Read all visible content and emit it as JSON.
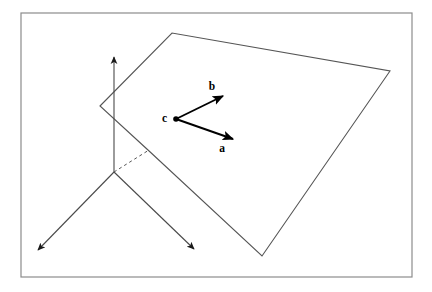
{
  "figure": {
    "title": "",
    "background_color": "#ffffff",
    "border": {
      "name": "figure-frame",
      "color": "#8c8c8c",
      "stroke_width": 1.2,
      "x": 21,
      "y": 13,
      "width": 391,
      "height": 264
    },
    "line_color": "#555555",
    "axis_color": "#4a4a4a",
    "vector_color": "#000000",
    "plane": {
      "name": "plane-polygon",
      "vertices": [
        {
          "x": 100,
          "y": 106
        },
        {
          "x": 172,
          "y": 33
        },
        {
          "x": 390,
          "y": 71
        },
        {
          "x": 262,
          "y": 256
        },
        {
          "x": 148,
          "y": 150
        }
      ],
      "closed": true,
      "stroke_width": 1.1
    },
    "axes": [
      {
        "name": "axis-vertical",
        "label": "",
        "from": {
          "x": 114,
          "y": 172
        },
        "to": {
          "x": 114,
          "y": 57
        },
        "arrow": true,
        "stroke_width": 1.1
      },
      {
        "name": "axis-lower-left",
        "label": "",
        "from": {
          "x": 114,
          "y": 172
        },
        "to": {
          "x": 38,
          "y": 250
        },
        "arrow": true,
        "stroke_width": 1.1
      },
      {
        "name": "axis-lower-right",
        "label": "",
        "from": {
          "x": 114,
          "y": 172
        },
        "to": {
          "x": 194,
          "y": 249
        },
        "arrow": true,
        "stroke_width": 1.1
      }
    ],
    "hidden_edge": {
      "name": "hidden-edge-dashed",
      "from": {
        "x": 114,
        "y": 172
      },
      "to": {
        "x": 149,
        "y": 150
      },
      "dash": "3,3",
      "stroke_width": 1.0
    },
    "origin_point": {
      "x": 114,
      "y": 172
    },
    "point_c": {
      "name": "point-c",
      "x": 176,
      "y": 119,
      "radius": 2.8,
      "label": "c",
      "label_x": 167,
      "label_y": 122
    },
    "vectors": [
      {
        "name": "vector-b",
        "label": "b",
        "from": {
          "x": 176,
          "y": 119
        },
        "to": {
          "x": 223,
          "y": 96
        },
        "label_x": 212,
        "label_y": 90,
        "stroke_width": 1.9
      },
      {
        "name": "vector-a",
        "label": "a",
        "from": {
          "x": 176,
          "y": 119
        },
        "to": {
          "x": 233,
          "y": 139
        },
        "label_x": 222,
        "label_y": 152,
        "stroke_width": 1.9
      }
    ]
  }
}
